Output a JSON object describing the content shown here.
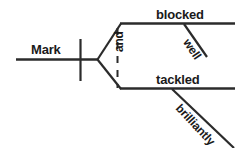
{
  "diagram": {
    "type": "sentence-diagram",
    "sentence": "Mark blocked well and tackled brilliantly",
    "style": "Reed-Kellogg",
    "background_color": "#ffffff",
    "line_color": "#2b2b2b",
    "text_color": "#1a1a1a",
    "labels": {
      "subject": "Mark",
      "conjunction": "and",
      "predicate_upper": "blocked",
      "predicate_lower": "tackled",
      "modifier_upper": "well",
      "modifier_lower": "brilliantly"
    },
    "parts": {
      "subject_baseline": "subject-baseline",
      "subject_verb_divider": "subject-verb-divider",
      "fork": "compound-predicate-fork",
      "conjunction_connector": "dashed-conjunction-line",
      "upper_predicate_baseline": "upper-predicate-baseline",
      "lower_predicate_baseline": "lower-predicate-baseline",
      "upper_modifier_slant": "upper-adverb-slant",
      "lower_modifier_slant": "lower-adverb-slant"
    }
  }
}
